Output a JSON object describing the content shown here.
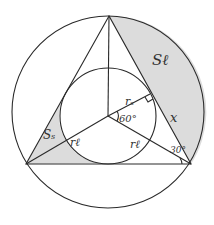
{
  "diagram": {
    "outer_circle": {
      "cx": 108,
      "cy": 112,
      "r": 96
    },
    "inner_circle": {
      "cx": 108,
      "cy": 116,
      "r": 48
    },
    "triangle": {
      "top": [
        109,
        15
      ],
      "bottom_left": [
        26,
        164
      ],
      "bottom_right": [
        191,
        164
      ]
    },
    "center": [
      108,
      116
    ],
    "shade_color": "#dcdcdc",
    "line_color": "#2a2a2a",
    "labels": {
      "large_region": "Sℓ",
      "small_region": "Sₛ",
      "inradius_top": "rₛ",
      "inradius_left": "rℓ",
      "circumradius_right": "rℓ",
      "angle_center": "60°",
      "side_segment": "x",
      "angle_vertex": "30°"
    }
  }
}
